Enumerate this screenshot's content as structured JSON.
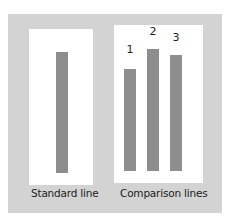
{
  "diagram": {
    "standard": {
      "label": "Standard line",
      "bar_color": "#8d8d8d"
    },
    "comparison": {
      "label": "Comparison lines",
      "lines": [
        {
          "number": "1"
        },
        {
          "number": "2"
        },
        {
          "number": "3"
        }
      ]
    },
    "colors": {
      "background_frame": "#d3d3d3",
      "panel": "#ffffff",
      "bar": "#8d8d8d"
    }
  }
}
